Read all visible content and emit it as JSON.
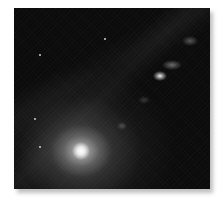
{
  "image": {
    "subject": "galaxy with bright core and relativistic jet",
    "colors": {
      "background": "#0b0b0b",
      "core": "#ffffff",
      "halo": "#aaaaaa",
      "page": "#ffffff"
    },
    "features": {
      "core_position": [
        67,
        143
      ],
      "jet_knots": [
        {
          "x": 146,
          "y": 68,
          "brightness": "high"
        },
        {
          "x": 158,
          "y": 57,
          "brightness": "medium"
        },
        {
          "x": 176,
          "y": 33,
          "brightness": "medium"
        },
        {
          "x": 130,
          "y": 92,
          "brightness": "low"
        },
        {
          "x": 108,
          "y": 118,
          "brightness": "low"
        }
      ],
      "stars": [
        {
          "x": 25,
          "y": 46
        },
        {
          "x": 20,
          "y": 110
        },
        {
          "x": 25,
          "y": 138
        },
        {
          "x": 90,
          "y": 30
        }
      ]
    }
  }
}
